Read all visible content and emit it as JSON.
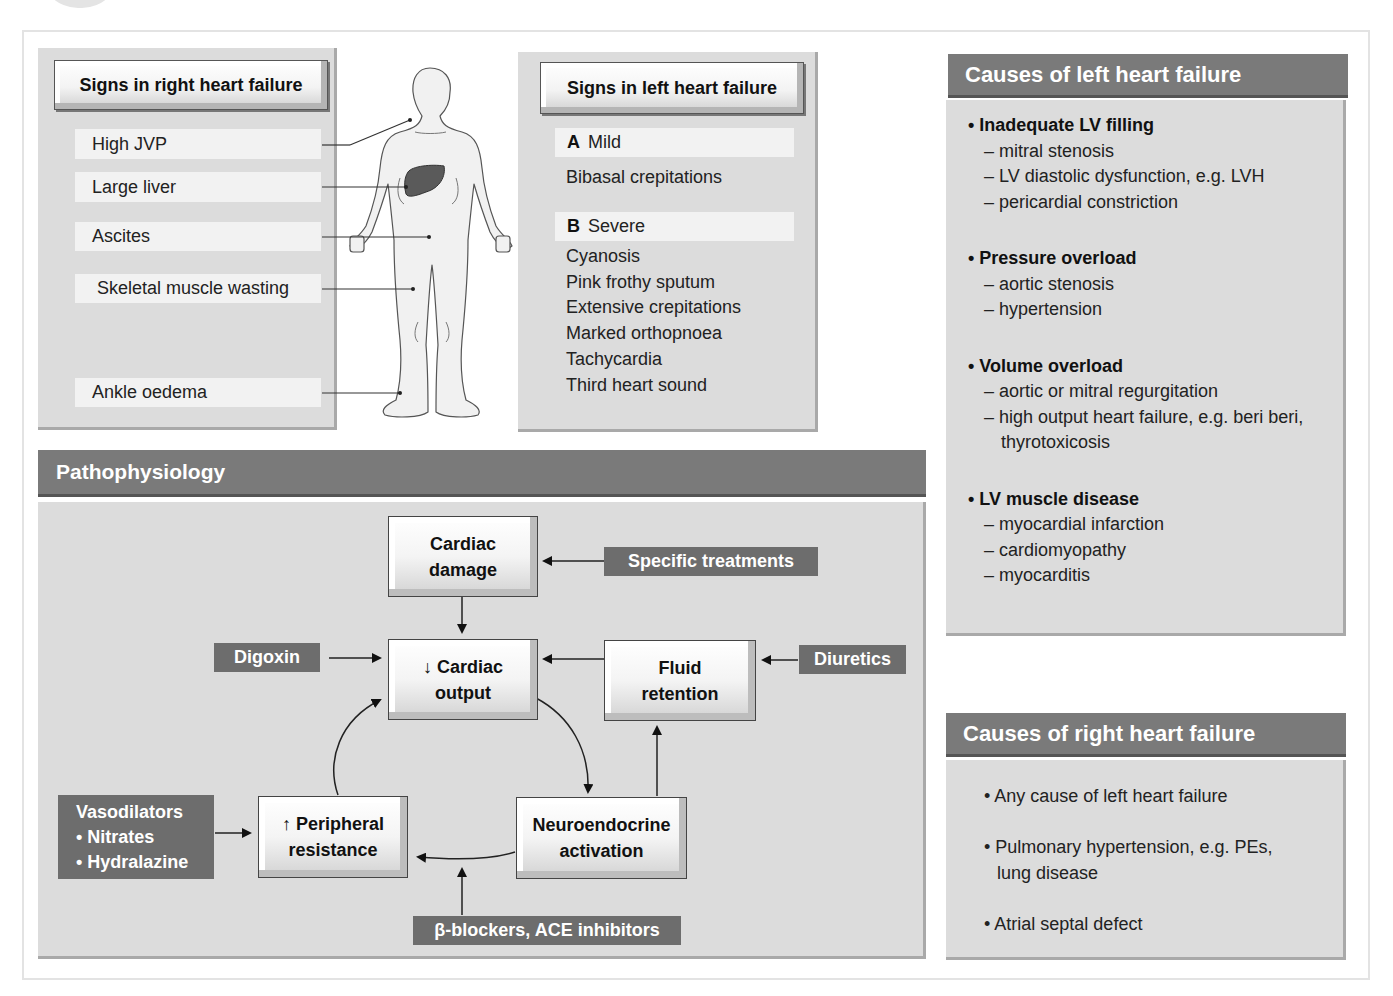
{
  "right_signs": {
    "title": "Signs in right heart failure",
    "items": [
      "High JVP",
      "Large liver",
      "Ascites",
      "Skeletal muscle wasting",
      "Ankle oedema"
    ]
  },
  "left_signs": {
    "title": "Signs in left heart failure",
    "mild_letter": "A",
    "mild_label": "Mild",
    "mild_items": [
      "Bibasal crepitations"
    ],
    "severe_letter": "B",
    "severe_label": "Severe",
    "severe_items": [
      "Cyanosis",
      "Pink frothy sputum",
      "Extensive crepitations",
      "Marked orthopnoea",
      "Tachycardia",
      "Third heart sound"
    ]
  },
  "causes_left": {
    "title": "Causes of left heart failure",
    "groups": [
      {
        "heading": "• Inadequate LV filling",
        "items": [
          "– mitral stenosis",
          "– LV diastolic dysfunction, e.g. LVH",
          "– pericardial constriction"
        ]
      },
      {
        "heading": "• Pressure overload",
        "items": [
          "– aortic stenosis",
          "– hypertension"
        ]
      },
      {
        "heading": "• Volume overload",
        "items": [
          "– aortic or mitral regurgitation",
          "– high output heart failure, e.g. beri beri,",
          "  thyrotoxicosis"
        ]
      },
      {
        "heading": "• LV muscle disease",
        "items": [
          "– myocardial infarction",
          "– cardiomyopathy",
          "– myocarditis"
        ]
      }
    ]
  },
  "causes_right": {
    "title": "Causes of right heart failure",
    "items": [
      "• Any cause of left heart failure",
      "• Pulmonary hypertension, e.g. PEs,",
      "lung disease",
      "• Atrial septal defect"
    ]
  },
  "pathophysiology": {
    "title": "Pathophysiology",
    "boxes": {
      "cardiac_damage": [
        "Cardiac",
        "damage"
      ],
      "cardiac_output": [
        "↓ Cardiac",
        "output"
      ],
      "fluid_retention": [
        "Fluid",
        "retention"
      ],
      "neuroendocrine": [
        "Neuroendocrine",
        "activation"
      ],
      "peripheral": [
        "↑ Peripheral",
        "resistance"
      ]
    },
    "drugs": {
      "specific": "Specific treatments",
      "digoxin": "Digoxin",
      "diuretics": "Diuretics",
      "vasodilators": [
        "Vasodilators",
        "• Nitrates",
        "• Hydralazine"
      ],
      "beta_ace": "β-blockers, ACE inhibitors"
    }
  }
}
